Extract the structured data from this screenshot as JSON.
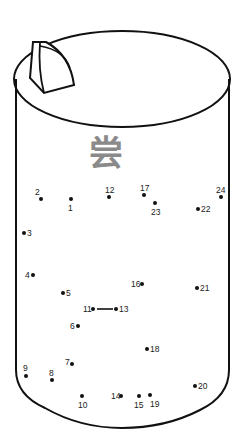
{
  "worksheet": {
    "type": "connect-the-dots",
    "subject": "cylindrical container with lid and knob",
    "character": "尝",
    "character_color": "#8a8a8a",
    "outline_color": "#111111",
    "dots": [
      {
        "n": "1",
        "x": 71,
        "y": 199,
        "lx": 68,
        "ly": 204
      },
      {
        "n": "2",
        "x": 41,
        "y": 199,
        "lx": 35,
        "ly": 188
      },
      {
        "n": "3",
        "x": 24,
        "y": 233,
        "lx": 27,
        "ly": 229
      },
      {
        "n": "4",
        "x": 33,
        "y": 275,
        "lx": 25,
        "ly": 271
      },
      {
        "n": "5",
        "x": 63,
        "y": 293,
        "lx": 66,
        "ly": 289
      },
      {
        "n": "6",
        "x": 78,
        "y": 326,
        "lx": 70,
        "ly": 322
      },
      {
        "n": "7",
        "x": 72,
        "y": 364,
        "lx": 65,
        "ly": 358
      },
      {
        "n": "8",
        "x": 52,
        "y": 380,
        "lx": 49,
        "ly": 369
      },
      {
        "n": "9",
        "x": 26,
        "y": 376,
        "lx": 23,
        "ly": 364
      },
      {
        "n": "10",
        "x": 82,
        "y": 396,
        "lx": 78,
        "ly": 401
      },
      {
        "n": "11",
        "x": 93,
        "y": 309,
        "lx": 83,
        "ly": 305
      },
      {
        "n": "12",
        "x": 109,
        "y": 197,
        "lx": 105,
        "ly": 186
      },
      {
        "n": "13",
        "x": 116,
        "y": 309,
        "lx": 119,
        "ly": 305
      },
      {
        "n": "14",
        "x": 121,
        "y": 396,
        "lx": 111,
        "ly": 392
      },
      {
        "n": "15",
        "x": 139,
        "y": 396,
        "lx": 134,
        "ly": 401
      },
      {
        "n": "16",
        "x": 142,
        "y": 284,
        "lx": 131,
        "ly": 280
      },
      {
        "n": "17",
        "x": 144,
        "y": 195,
        "lx": 140,
        "ly": 184
      },
      {
        "n": "18",
        "x": 147,
        "y": 349,
        "lx": 150,
        "ly": 345
      },
      {
        "n": "19",
        "x": 150,
        "y": 395,
        "lx": 150,
        "ly": 400
      },
      {
        "n": "20",
        "x": 195,
        "y": 386,
        "lx": 198,
        "ly": 382
      },
      {
        "n": "21",
        "x": 197,
        "y": 288,
        "lx": 200,
        "ly": 284
      },
      {
        "n": "22",
        "x": 198,
        "y": 209,
        "lx": 201,
        "ly": 205
      },
      {
        "n": "23",
        "x": 155,
        "y": 203,
        "lx": 151,
        "ly": 208
      },
      {
        "n": "24",
        "x": 221,
        "y": 197,
        "lx": 216,
        "ly": 186
      }
    ],
    "preconnected_segment": {
      "from": "11",
      "to": "13"
    }
  }
}
